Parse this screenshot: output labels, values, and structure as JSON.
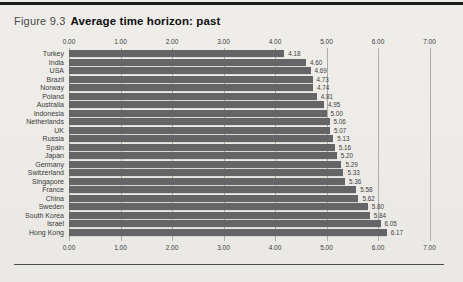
{
  "figure": {
    "label": "Figure 9.3",
    "title": "Average time horizon: past"
  },
  "chart_data": {
    "type": "bar",
    "orientation": "horizontal",
    "title": "Average time horizon: past",
    "categories": [
      "Turkey",
      "India",
      "USA",
      "Brazil",
      "Norway",
      "Poland",
      "Australia",
      "Indonesia",
      "Netherlands",
      "UK",
      "Russia",
      "Spain",
      "Japan",
      "Germany",
      "Switzerland",
      "Singapore",
      "France",
      "China",
      "Sweden",
      "South Korea",
      "Israel",
      "Hong Kong"
    ],
    "values": [
      4.18,
      4.6,
      4.69,
      4.73,
      4.74,
      4.81,
      4.95,
      5.0,
      5.06,
      5.07,
      5.13,
      5.16,
      5.2,
      5.29,
      5.33,
      5.36,
      5.58,
      5.62,
      5.8,
      5.84,
      6.05,
      6.17
    ],
    "value_labels": [
      "4.18",
      "4.60",
      "4.69",
      "4.73",
      "4.74",
      "4.81",
      "4.95",
      "5.00",
      "5.06",
      "5.07",
      "5.13",
      "5.16",
      "5.20",
      "5.29",
      "5.33",
      "5.36",
      "5.58",
      "5.62",
      "5.80",
      "5.84",
      "6.05",
      "6.17"
    ],
    "x_ticks": [
      "0.00",
      "1.00",
      "2.00",
      "3.00",
      "4.00",
      "5.00",
      "6.00",
      "7.00"
    ],
    "xlim": [
      0,
      7
    ],
    "xlabel": "",
    "ylabel": "",
    "axis_label_positions": [
      "top",
      "bottom"
    ],
    "grid": true,
    "legend": false,
    "bar_color": "#656567",
    "gridline_color": "#aeaca7",
    "background_color": "#edecE8"
  }
}
